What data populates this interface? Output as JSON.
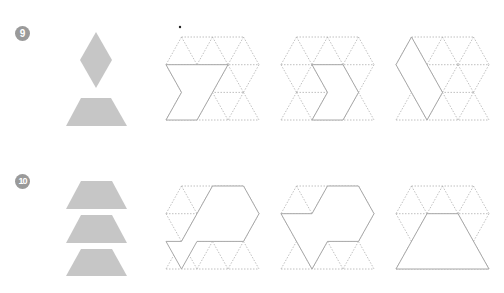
{
  "problems": [
    {
      "number": "9",
      "pieces": [
        "rhombus",
        "trapezoid"
      ],
      "grids": 3
    },
    {
      "number": "10",
      "pieces": [
        "trapezoid",
        "trapezoid",
        "trapezoid"
      ],
      "grids": 3
    }
  ],
  "colors": {
    "piece_fill": "#c6c6c6",
    "badge": "#9a9a9a",
    "grid_line": "#b0b0b0"
  }
}
